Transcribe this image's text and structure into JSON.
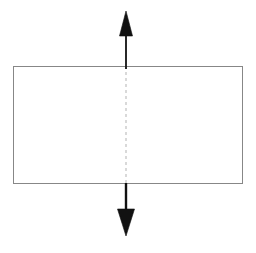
{
  "figure": {
    "title": "",
    "caption": "",
    "background_color": "#ffffff",
    "width": 256,
    "height": 253
  },
  "colors": {
    "rect_stroke": "#878787",
    "dashed_line": "#c9c9c9",
    "arrow_fill": "#111111",
    "arrow_stroke": "#111111",
    "canvas": "#ffffff"
  },
  "shapes": {
    "rectangle": {
      "name": "rectangle-outline",
      "x": 13,
      "y": 66,
      "width": 229,
      "height": 117,
      "fill": "none",
      "stroke_width": 1
    },
    "dashed_axis": {
      "name": "vertical-dashed-centerline",
      "x": 126,
      "y_start": 66,
      "y_end": 183,
      "stroke_width": 1.4,
      "dash": "3 3"
    },
    "arrow_up": {
      "name": "arrow-up",
      "x": 126,
      "shaft_top": 35,
      "shaft_bottom": 69,
      "shaft_width": 1.8,
      "head_tip_y": 11,
      "head_base_y": 36,
      "head_half_width": 6.5,
      "direction": "up"
    },
    "arrow_down": {
      "name": "arrow-down",
      "x": 126,
      "shaft_top": 183,
      "shaft_bottom": 210,
      "shaft_width": 2.4,
      "head_tip_y": 236,
      "head_base_y": 209,
      "head_half_width": 8.5,
      "direction": "down"
    }
  },
  "labels": {
    "items": []
  }
}
